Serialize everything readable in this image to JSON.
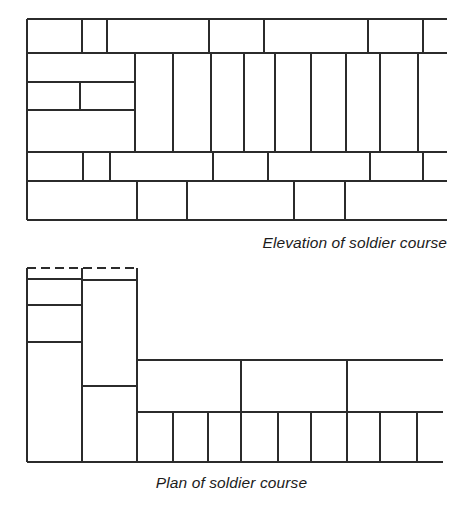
{
  "figure": {
    "background_color": "#ffffff",
    "line_color": "#2b2b2b",
    "width": 463,
    "height": 507
  },
  "captions": {
    "elevation": "Elevation of soldier course",
    "plan": "Plan of soldier course"
  },
  "elevation": {
    "name": "Elevation of soldier course",
    "bounds": {
      "left": 27,
      "right": 447,
      "top": 19,
      "bottom": 220
    },
    "course_rows": [
      {
        "name": "stretcher-course-top",
        "top": 19,
        "bottom": 53,
        "joints": [
          82,
          107,
          209,
          264,
          368,
          423
        ]
      },
      {
        "name": "soldier-course-band",
        "top": 53,
        "bottom": 152,
        "joints": [
          135,
          173,
          211,
          244,
          275,
          311,
          346,
          380,
          418
        ]
      },
      {
        "name": "stretcher-course-below-soldiers",
        "top": 152,
        "bottom": 181,
        "joints": [
          83,
          110,
          213,
          268,
          370,
          423
        ]
      },
      {
        "name": "stretcher-course-bottom",
        "top": 181,
        "bottom": 220,
        "joints": [
          137,
          187,
          294,
          345
        ]
      }
    ],
    "backing_brickwork": {
      "name": "backing-stretcher-bricks-left",
      "right_edge": 135,
      "inner_horizontals": [
        {
          "y": 82,
          "x1": 27,
          "x2": 135
        },
        {
          "y": 110,
          "x1": 27,
          "x2": 135
        }
      ],
      "inner_verticals": [
        {
          "x": 80,
          "y1": 82,
          "y2": 110
        }
      ]
    }
  },
  "plan": {
    "name": "Plan of soldier course",
    "bounds": {
      "left": 27,
      "right": 443,
      "top": 268,
      "bottom": 462
    },
    "hidden_line": {
      "name": "dashed-hidden-edge",
      "y": 268,
      "x1": 27,
      "x2": 137,
      "style": "dashed"
    },
    "left_column": {
      "name": "plan-left-return-column",
      "left": 27,
      "right": 82,
      "top": 268,
      "bottom": 462,
      "joints_y": [
        279,
        305,
        342
      ]
    },
    "second_column": {
      "name": "plan-second-column",
      "left": 82,
      "right": 137,
      "top": 268,
      "bottom": 462,
      "joints_y": [
        280,
        386
      ]
    },
    "upper_wide_row": {
      "name": "plan-soldier-heads-row",
      "left": 137,
      "right": 443,
      "top": 360,
      "bottom": 412,
      "joints_x": [
        241,
        347
      ]
    },
    "lower_wide_row": {
      "name": "plan-soldier-bricks-row",
      "left": 137,
      "right": 443,
      "top": 412,
      "bottom": 462,
      "joints_x": [
        173,
        208,
        241,
        278,
        311,
        347,
        380,
        417
      ]
    }
  }
}
